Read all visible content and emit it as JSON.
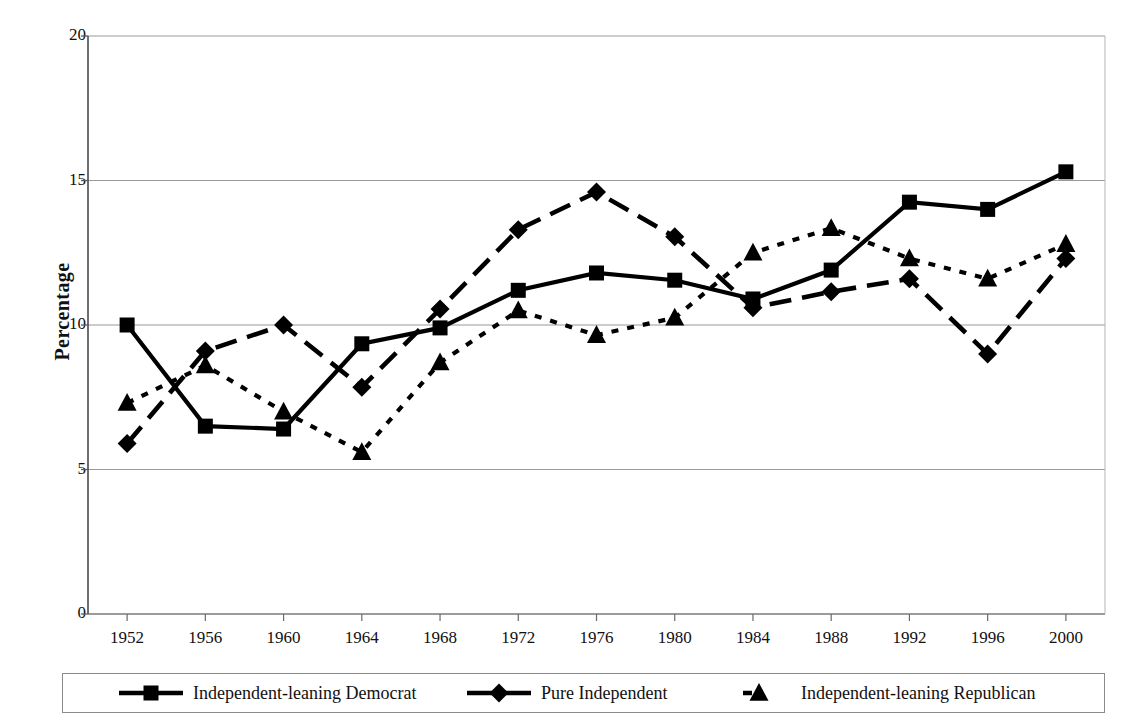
{
  "chart_data": {
    "type": "line",
    "title": "",
    "xlabel": "",
    "ylabel": "Percentage",
    "categories": [
      "1952",
      "1956",
      "1960",
      "1964",
      "1968",
      "1972",
      "1976",
      "1980",
      "1984",
      "1988",
      "1992",
      "1996",
      "2000"
    ],
    "yticks": [
      "0",
      "5",
      "10",
      "15",
      "20"
    ],
    "ylim": [
      0,
      20
    ],
    "grid": "horizontal",
    "legend_position": "bottom",
    "series": [
      {
        "name": "Independent-leaning Democrat",
        "marker": "square",
        "linestyle": "solid",
        "color": "#000000",
        "values": [
          10.0,
          6.5,
          6.4,
          9.35,
          9.9,
          11.2,
          11.8,
          11.55,
          10.9,
          11.9,
          14.25,
          14.0,
          15.3
        ]
      },
      {
        "name": "Pure Independent",
        "marker": "diamond",
        "linestyle": "long-dash",
        "color": "#000000",
        "values": [
          5.9,
          9.1,
          10.0,
          7.85,
          10.55,
          13.3,
          14.6,
          13.05,
          10.6,
          11.15,
          11.6,
          9.0,
          12.3
        ]
      },
      {
        "name": "Independent-leaning Republican",
        "marker": "triangle",
        "linestyle": "dotted",
        "color": "#000000",
        "values": [
          7.3,
          8.6,
          7.0,
          5.6,
          8.7,
          10.5,
          9.65,
          10.25,
          12.5,
          13.35,
          12.3,
          11.6,
          12.8
        ]
      }
    ]
  },
  "axis": {
    "y_label": "Percentage"
  },
  "legend": {
    "items": [
      {
        "label": "Independent-leaning Democrat"
      },
      {
        "label": "Pure Independent"
      },
      {
        "label": "Independent-leaning Republican"
      }
    ]
  }
}
